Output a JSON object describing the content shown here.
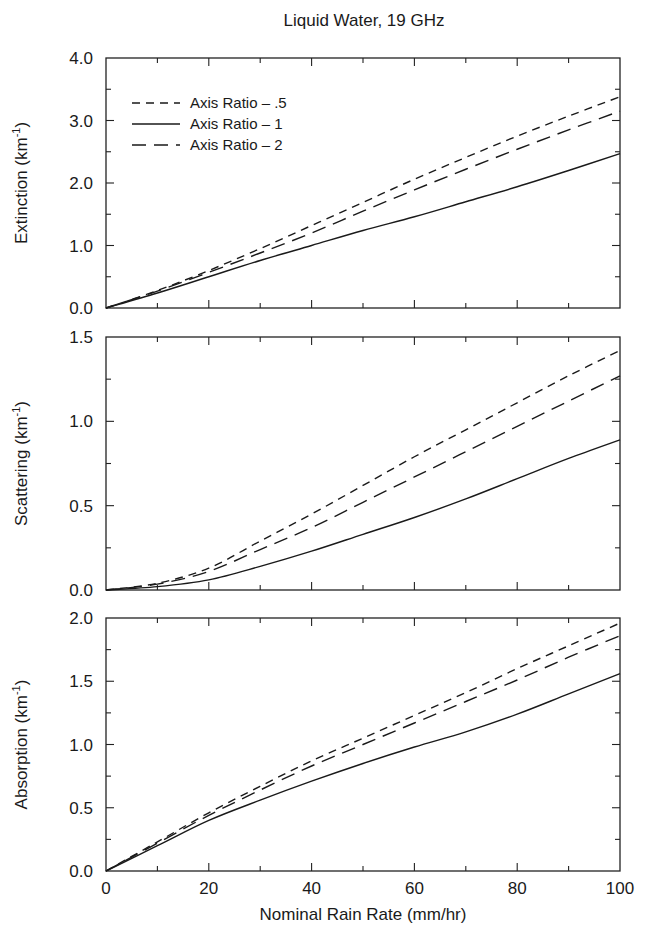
{
  "figure": {
    "title": "Liquid Water, 19 GHz",
    "xlabel": "Nominal Rain Rate (mm/hr)"
  },
  "legend": {
    "items": [
      {
        "label": "Axis Ratio – .5",
        "style": "short-dash"
      },
      {
        "label": "Axis Ratio – 1",
        "style": "solid"
      },
      {
        "label": "Axis Ratio – 2",
        "style": "long-dash"
      }
    ]
  },
  "chart_data": [
    {
      "type": "line",
      "title": "Liquid Water, 19 GHz",
      "xlabel": "Nominal Rain Rate (mm/hr)",
      "ylabel": "Extinction (km⁻¹)",
      "ylabel_base": "Extinction (km",
      "ylabel_sup": "-1",
      "xlim": [
        0,
        100
      ],
      "ylim": [
        0,
        4.0
      ],
      "xticks": [
        0,
        20,
        40,
        60,
        80,
        100
      ],
      "yticks": [
        "0.0",
        "1.0",
        "2.0",
        "3.0",
        "4.0"
      ],
      "ytick_values": [
        0,
        1,
        2,
        3,
        4
      ],
      "yminor": 0.5,
      "grid": false,
      "legend_position": "upper left",
      "x": [
        0,
        10,
        20,
        30,
        40,
        50,
        60,
        70,
        80,
        90,
        100
      ],
      "series": [
        {
          "name": "Axis Ratio - .5",
          "style": "short-dash",
          "values": [
            0,
            0.28,
            0.6,
            0.95,
            1.32,
            1.69,
            2.06,
            2.41,
            2.75,
            3.07,
            3.38
          ]
        },
        {
          "name": "Axis Ratio - 1",
          "style": "solid",
          "values": [
            0,
            0.24,
            0.5,
            0.76,
            1.0,
            1.24,
            1.46,
            1.7,
            1.94,
            2.2,
            2.47
          ]
        },
        {
          "name": "Axis Ratio - 2",
          "style": "long-dash",
          "values": [
            0,
            0.27,
            0.57,
            0.88,
            1.2,
            1.55,
            1.89,
            2.22,
            2.54,
            2.85,
            3.15
          ]
        }
      ]
    },
    {
      "type": "line",
      "ylabel": "Scattering (km⁻¹)",
      "ylabel_base": "Scattering (km",
      "ylabel_sup": "-1",
      "xlim": [
        0,
        100
      ],
      "ylim": [
        0,
        1.5
      ],
      "xticks": [
        0,
        20,
        40,
        60,
        80,
        100
      ],
      "yticks": [
        "0.0",
        "0.5",
        "1.0",
        "1.5"
      ],
      "ytick_values": [
        0,
        0.5,
        1.0,
        1.5
      ],
      "yminor": 0.25,
      "grid": false,
      "x": [
        0,
        10,
        20,
        30,
        40,
        50,
        60,
        70,
        80,
        90,
        100
      ],
      "series": [
        {
          "name": "Axis Ratio - .5",
          "style": "short-dash",
          "values": [
            0,
            0.04,
            0.13,
            0.29,
            0.45,
            0.62,
            0.79,
            0.95,
            1.11,
            1.27,
            1.42
          ]
        },
        {
          "name": "Axis Ratio - 1",
          "style": "solid",
          "values": [
            0,
            0.02,
            0.06,
            0.14,
            0.23,
            0.33,
            0.43,
            0.54,
            0.66,
            0.78,
            0.89
          ]
        },
        {
          "name": "Axis Ratio - 2",
          "style": "long-dash",
          "values": [
            0,
            0.035,
            0.11,
            0.24,
            0.37,
            0.52,
            0.67,
            0.82,
            0.97,
            1.12,
            1.27
          ]
        }
      ]
    },
    {
      "type": "line",
      "ylabel": "Absorption (km⁻¹)",
      "ylabel_base": "Absorption (km",
      "ylabel_sup": "-1",
      "xlim": [
        0,
        100
      ],
      "ylim": [
        0,
        2.0
      ],
      "xticks": [
        0,
        20,
        40,
        60,
        80,
        100
      ],
      "xtick_labels": [
        "0",
        "20",
        "40",
        "60",
        "80",
        "100"
      ],
      "yticks": [
        "0.0",
        "0.5",
        "1.0",
        "1.5",
        "2.0"
      ],
      "ytick_values": [
        0,
        0.5,
        1.0,
        1.5,
        2.0
      ],
      "yminor": 0.25,
      "grid": false,
      "x": [
        0,
        10,
        20,
        30,
        40,
        50,
        60,
        70,
        80,
        90,
        100
      ],
      "series": [
        {
          "name": "Axis Ratio - .5",
          "style": "short-dash",
          "values": [
            0,
            0.23,
            0.46,
            0.67,
            0.87,
            1.05,
            1.23,
            1.41,
            1.6,
            1.78,
            1.96
          ]
        },
        {
          "name": "Axis Ratio - 1",
          "style": "solid",
          "values": [
            0,
            0.2,
            0.4,
            0.56,
            0.71,
            0.85,
            0.98,
            1.1,
            1.24,
            1.4,
            1.56
          ]
        },
        {
          "name": "Axis Ratio - 2",
          "style": "long-dash",
          "values": [
            0,
            0.22,
            0.44,
            0.64,
            0.83,
            1.0,
            1.17,
            1.34,
            1.51,
            1.69,
            1.86
          ]
        }
      ]
    }
  ]
}
